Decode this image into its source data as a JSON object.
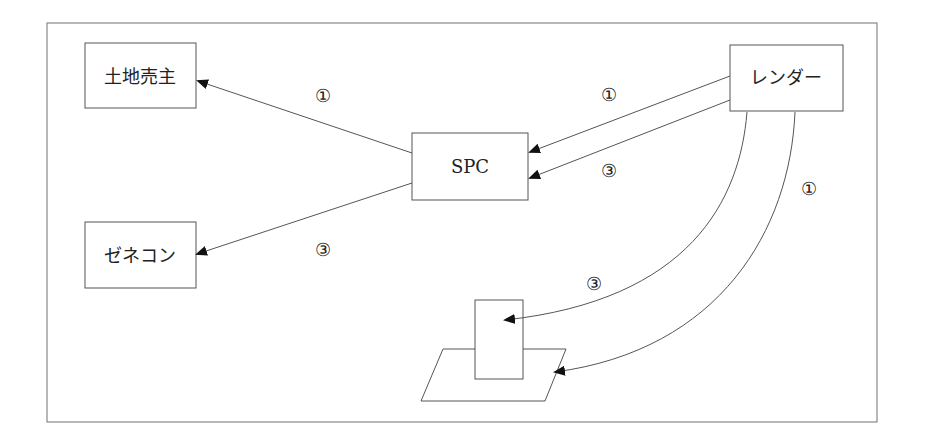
{
  "nodes": {
    "landowner": "土地売主",
    "general_contractor": "ゼネコン",
    "spc": "SPC",
    "lender": "レンダー"
  },
  "edge_labels": {
    "spc_to_landowner": "①",
    "spc_to_contractor": "③",
    "lender_to_spc_1": "①",
    "lender_to_spc_3": "③",
    "lender_to_building": "③",
    "lender_to_land": "①"
  },
  "colors": {
    "line": "#555555",
    "arrow": "#111111",
    "border": "#777777"
  }
}
